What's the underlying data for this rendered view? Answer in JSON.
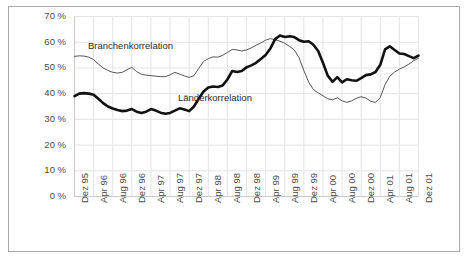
{
  "figure": {
    "name": "correlation-chart",
    "background_color": "#ffffff",
    "border_color": "#a8a8a8"
  },
  "annotations": [
    {
      "name": "branchenkorrelation-label",
      "text": "Branchenkorrelation",
      "x": 88,
      "y": 40
    },
    {
      "name": "laenderkorrelation-label",
      "text": "Länderkorrelation",
      "x": 178,
      "y": 92
    }
  ],
  "chart_data": {
    "type": "line",
    "title": "",
    "subtitle": "",
    "xlabel": "",
    "ylabel": "",
    "ylim": [
      0,
      70
    ],
    "yticks": [
      0,
      10,
      20,
      30,
      40,
      50,
      60,
      70
    ],
    "ytick_labels": [
      "0 %",
      "10 %",
      "20 %",
      "30 %",
      "40 %",
      "50 %",
      "60 %",
      "70 %"
    ],
    "grid": true,
    "grid_color": "#e3e3e8",
    "legend_position": "inline-annotation",
    "x": [
      "Dez 95",
      "Jan 96",
      "Feb 96",
      "Mrz 96",
      "Apr 96",
      "Mai 96",
      "Jun 96",
      "Jul 96",
      "Aug 96",
      "Sep 96",
      "Okt 96",
      "Nov 96",
      "Dez 96",
      "Jan 97",
      "Feb 97",
      "Mrz 97",
      "Apr 97",
      "Mai 97",
      "Jun 97",
      "Jul 97",
      "Aug 97",
      "Sep 97",
      "Okt 97",
      "Nov 97",
      "Dez 97",
      "Jan 98",
      "Feb 98",
      "Mrz 98",
      "Apr 98",
      "Mai 98",
      "Jun 98",
      "Jul 98",
      "Aug 98",
      "Sep 98",
      "Okt 98",
      "Nov 98",
      "Dez 98",
      "Jan 99",
      "Feb 99",
      "Mrz 99",
      "Apr 99",
      "Mai 99",
      "Jun 99",
      "Jul 99",
      "Aug 99",
      "Sep 99",
      "Okt 99",
      "Nov 99",
      "Dez 99",
      "Jan 00",
      "Feb 00",
      "Mrz 00",
      "Apr 00",
      "Mai 00",
      "Jun 00",
      "Jul 00",
      "Aug 00",
      "Sep 00",
      "Okt 00",
      "Nov 00",
      "Dez 00",
      "Jan 01",
      "Feb 01",
      "Mrz 01",
      "Apr 01",
      "Mai 01",
      "Jun 01",
      "Jul 01",
      "Aug 01",
      "Sep 01",
      "Okt 01",
      "Nov 01",
      "Dez 01"
    ],
    "xtick_labels": [
      "Dez 95",
      "Apr 96",
      "Aug 96",
      "Dez 96",
      "Apr 97",
      "Aug 97",
      "Dez 97",
      "Apr 98",
      "Aug 98",
      "Dez 98",
      "Apr 99",
      "Aug 99",
      "Dez 99",
      "Apr 00",
      "Aug 00",
      "Dez 00",
      "Apr 01",
      "Aug 01",
      "Dez 01"
    ],
    "xtick_indices": [
      0,
      4,
      8,
      12,
      16,
      20,
      24,
      28,
      32,
      36,
      40,
      44,
      48,
      52,
      56,
      60,
      64,
      68,
      72
    ],
    "series": [
      {
        "name": "Branchenkorrelation",
        "line_width": 1,
        "color": "#555555",
        "values": [
          54.5,
          54.7,
          54.6,
          54.2,
          53.2,
          51.5,
          50.0,
          49.0,
          48.3,
          48.0,
          48.3,
          49.3,
          50.2,
          48.6,
          47.5,
          47.2,
          47.0,
          46.8,
          46.6,
          46.6,
          47.3,
          48.3,
          47.6,
          46.9,
          46.3,
          47.0,
          49.8,
          52.5,
          53.6,
          54.3,
          54.2,
          54.9,
          56.0,
          57.2,
          57.0,
          56.6,
          57.0,
          57.8,
          58.8,
          59.7,
          60.8,
          61.4,
          61.0,
          60.4,
          59.6,
          58.4,
          57.0,
          54.0,
          49.0,
          44.5,
          41.6,
          40.3,
          39.2,
          38.0,
          37.6,
          38.4,
          37.2,
          36.6,
          37.2,
          38.2,
          38.8,
          38.3,
          37.0,
          36.6,
          38.5,
          43.5,
          46.8,
          48.4,
          49.5,
          50.4,
          51.5,
          52.8,
          53.8
        ]
      },
      {
        "name": "Länderkorrelation",
        "line_width": 2.6,
        "color": "#111111",
        "values": [
          39.0,
          40.0,
          40.2,
          40.0,
          39.6,
          38.0,
          36.3,
          35.0,
          34.2,
          33.6,
          33.2,
          33.4,
          34.0,
          33.0,
          32.5,
          33.0,
          34.0,
          33.4,
          32.6,
          32.2,
          32.5,
          33.4,
          34.3,
          33.8,
          33.2,
          35.0,
          38.0,
          40.8,
          42.4,
          42.8,
          42.6,
          43.2,
          45.5,
          48.8,
          48.4,
          48.8,
          50.2,
          51.0,
          52.0,
          53.5,
          55.0,
          57.6,
          61.2,
          62.6,
          62.0,
          62.3,
          62.0,
          60.8,
          60.2,
          60.4,
          59.0,
          56.6,
          52.0,
          47.0,
          44.6,
          46.4,
          44.4,
          45.6,
          45.2,
          45.0,
          46.0,
          47.2,
          47.5,
          48.4,
          51.2,
          57.2,
          58.4,
          57.0,
          55.6,
          55.4,
          54.6,
          53.8,
          54.8
        ]
      }
    ]
  }
}
